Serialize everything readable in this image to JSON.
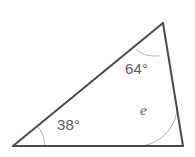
{
  "figure": {
    "kind": "triangle-angle-diagram",
    "background_color": "#ffffff",
    "width": 195,
    "height": 157,
    "edge_color": "#4a4a4a",
    "edge_width": 2,
    "arc_color": "#b4b4b4",
    "arc_width": 1,
    "label_color": "#5a5a5a",
    "vertices": [
      {
        "id": "A",
        "x": 13,
        "y": 146
      },
      {
        "id": "B",
        "x": 163,
        "y": 23
      },
      {
        "id": "C",
        "x": 183,
        "y": 146
      }
    ],
    "edges": [
      {
        "id": "AB",
        "from": "A",
        "to": "B"
      },
      {
        "id": "BC",
        "from": "B",
        "to": "C"
      },
      {
        "id": "CA",
        "from": "C",
        "to": "A"
      }
    ],
    "angles": [
      {
        "id": "angle-a",
        "vertex": "A",
        "label": "38°",
        "value": 38,
        "unit": "degrees",
        "known": true,
        "arc_radius": 32,
        "arc_path": "M 45 146 A 32 32 0 0 0 38.2 126.9"
      },
      {
        "id": "angle-b",
        "vertex": "B",
        "label": "64°",
        "value": 64,
        "unit": "degrees",
        "known": true,
        "arc_radius": 33,
        "arc_path": "M 136.1 50 A 33 33 0 0 0 159.2 55.9"
      },
      {
        "id": "angle-c",
        "vertex": "C",
        "label": "e",
        "value": null,
        "unit": "degrees",
        "known": false,
        "arc_radius": 41,
        "arc_path": "M 142 146 A 41 41 0 0 0 177.4 106.4"
      }
    ]
  }
}
